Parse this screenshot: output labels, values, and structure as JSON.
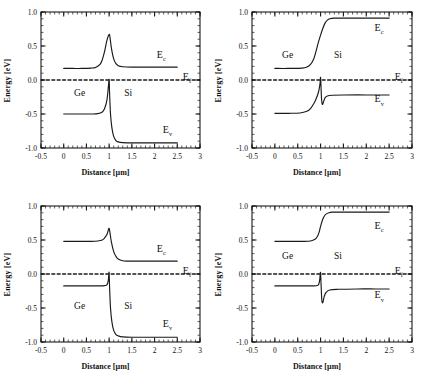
{
  "figure": {
    "panel_count": 4,
    "axis": {
      "xlabel": "Distance [µm]",
      "ylabel": "Energy [eV]",
      "xticks": [
        "-0.5",
        "0",
        "0.5",
        "1",
        "1.5",
        "2",
        "2.5",
        "3"
      ],
      "xtick_values": [
        -0.5,
        0,
        0.5,
        1,
        1.5,
        2,
        2.5,
        3
      ],
      "yticks": [
        "1.0",
        "0.5",
        "0.0",
        "-0.5",
        "-1.0"
      ],
      "ytick_values": [
        1.0,
        0.5,
        0.0,
        -0.5,
        -1.0
      ],
      "xlim": [
        -0.5,
        3
      ],
      "ylim": [
        -1.0,
        1.0
      ],
      "grid": false,
      "minor_tick_step_x": 0.1,
      "minor_tick_step_y": 0.1
    },
    "annotations": {
      "ec": "E",
      "ec_sub": "c",
      "ef": "E",
      "ef_sub": "f",
      "ev": "E",
      "ev_sub": "v",
      "region_left": "Ge",
      "region_right": "Si"
    },
    "colors": {
      "line": "#1a1a1a",
      "axis": "#1a1a1a",
      "background": "#ffffff",
      "text": "#111111"
    }
  },
  "chart_data": [
    {
      "type": "line",
      "title": "Top-left band diagram",
      "xlabel": "Distance [µm]",
      "ylabel": "Energy [eV]",
      "xlim": [
        -0.5,
        3
      ],
      "ylim": [
        -1.0,
        1.0
      ],
      "grid": false,
      "legend_position": "inline-right",
      "series": [
        {
          "name": "E_c",
          "label": "Ec",
          "label_x": 2.05,
          "label_y": 0.32,
          "x": [
            0,
            0.2,
            0.4,
            0.6,
            0.7,
            0.8,
            0.85,
            0.9,
            0.95,
            1.0,
            1.02,
            1.05,
            1.1,
            1.15,
            1.2,
            1.3,
            1.5,
            2.0,
            2.5
          ],
          "y": [
            0.17,
            0.17,
            0.17,
            0.175,
            0.185,
            0.23,
            0.3,
            0.42,
            0.58,
            0.67,
            0.62,
            0.47,
            0.31,
            0.24,
            0.21,
            0.195,
            0.19,
            0.19,
            0.19
          ]
        },
        {
          "name": "E_f",
          "label": "Ef",
          "label_x": 2.62,
          "label_y": 0.0,
          "dashed": true,
          "x": [
            -0.5,
            3
          ],
          "y": [
            0.0,
            0.0
          ]
        },
        {
          "name": "E_v",
          "label": "Ev",
          "label_x": 2.18,
          "label_y": -0.78,
          "x": [
            0,
            0.3,
            0.6,
            0.75,
            0.85,
            0.9,
            0.95,
            0.98,
            1.0,
            1.01,
            1.03,
            1.06,
            1.1,
            1.15,
            1.2,
            1.3,
            1.5,
            2.0,
            2.5
          ],
          "y": [
            -0.5,
            -0.5,
            -0.5,
            -0.495,
            -0.47,
            -0.42,
            -0.3,
            -0.12,
            0.01,
            -0.2,
            -0.5,
            -0.7,
            -0.83,
            -0.89,
            -0.91,
            -0.92,
            -0.925,
            -0.925,
            -0.925
          ]
        }
      ],
      "region_labels": [
        {
          "text": "Ge",
          "x": 0.35,
          "y": -0.23
        },
        {
          "text": "Si",
          "x": 1.42,
          "y": -0.23
        }
      ]
    },
    {
      "type": "line",
      "title": "Top-right band diagram",
      "xlabel": "Distance [µm]",
      "ylabel": "Energy [eV]",
      "xlim": [
        -0.5,
        3
      ],
      "ylim": [
        -1.0,
        1.0
      ],
      "grid": false,
      "legend_position": "inline-right",
      "series": [
        {
          "name": "E_c",
          "label": "Ec",
          "label_x": 2.18,
          "label_y": 0.72,
          "x": [
            0,
            0.3,
            0.6,
            0.7,
            0.78,
            0.85,
            0.9,
            0.95,
            1.0,
            1.05,
            1.1,
            1.15,
            1.2,
            1.3,
            1.5,
            2.0,
            2.5
          ],
          "y": [
            0.17,
            0.17,
            0.175,
            0.19,
            0.23,
            0.31,
            0.42,
            0.55,
            0.66,
            0.76,
            0.84,
            0.88,
            0.9,
            0.91,
            0.91,
            0.91,
            0.91
          ]
        },
        {
          "name": "E_f",
          "label": "Ef",
          "label_x": 2.62,
          "label_y": 0.0,
          "dashed": true,
          "x": [
            -0.5,
            3
          ],
          "y": [
            0.0,
            0.0
          ]
        },
        {
          "name": "E_v",
          "label": "Ev",
          "label_x": 2.18,
          "label_y": -0.33,
          "x": [
            0,
            0.3,
            0.55,
            0.7,
            0.78,
            0.85,
            0.9,
            0.94,
            0.97,
            0.99,
            1.0,
            1.01,
            1.02,
            1.04,
            1.07,
            1.1,
            1.15,
            1.25,
            1.5,
            2.0,
            2.5
          ],
          "y": [
            -0.49,
            -0.49,
            -0.485,
            -0.46,
            -0.42,
            -0.35,
            -0.28,
            -0.21,
            -0.13,
            -0.04,
            0.04,
            -0.1,
            -0.27,
            -0.36,
            -0.31,
            -0.26,
            -0.235,
            -0.225,
            -0.22,
            -0.22,
            -0.22
          ]
        }
      ],
      "region_labels": [
        {
          "text": "Ge",
          "x": 0.28,
          "y": 0.33
        },
        {
          "text": "Si",
          "x": 1.38,
          "y": 0.33
        }
      ]
    },
    {
      "type": "line",
      "title": "Bottom-left band diagram",
      "xlabel": "Distance [µm]",
      "ylabel": "Energy [eV]",
      "xlim": [
        -0.5,
        3
      ],
      "ylim": [
        -1.0,
        1.0
      ],
      "grid": false,
      "legend_position": "inline-right",
      "series": [
        {
          "name": "E_c",
          "label": "Ec",
          "label_x": 2.05,
          "label_y": 0.32,
          "x": [
            0,
            0.3,
            0.6,
            0.75,
            0.85,
            0.9,
            0.95,
            0.98,
            1.0,
            1.02,
            1.05,
            1.1,
            1.15,
            1.2,
            1.3,
            1.4,
            1.6,
            2.0,
            2.5
          ],
          "y": [
            0.48,
            0.48,
            0.48,
            0.485,
            0.5,
            0.53,
            0.58,
            0.64,
            0.67,
            0.6,
            0.47,
            0.33,
            0.26,
            0.22,
            0.195,
            0.19,
            0.19,
            0.19,
            0.19
          ]
        },
        {
          "name": "E_f",
          "label": "Ef",
          "label_x": 2.62,
          "label_y": 0.0,
          "dashed": true,
          "x": [
            -0.5,
            3
          ],
          "y": [
            0.0,
            0.0
          ]
        },
        {
          "name": "E_v",
          "label": "Ev",
          "label_x": 2.18,
          "label_y": -0.78,
          "x": [
            0,
            0.3,
            0.6,
            0.8,
            0.9,
            0.95,
            0.98,
            0.99,
            1.0,
            1.01,
            1.03,
            1.06,
            1.1,
            1.15,
            1.2,
            1.3,
            1.5,
            2.0,
            2.5
          ],
          "y": [
            -0.175,
            -0.175,
            -0.175,
            -0.175,
            -0.17,
            -0.16,
            -0.1,
            -0.03,
            0.02,
            -0.2,
            -0.5,
            -0.7,
            -0.83,
            -0.89,
            -0.91,
            -0.925,
            -0.93,
            -0.93,
            -0.93
          ]
        }
      ],
      "region_labels": [
        {
          "text": "Ge",
          "x": 0.35,
          "y": -0.52
        },
        {
          "text": "Si",
          "x": 1.42,
          "y": -0.52
        }
      ]
    },
    {
      "type": "line",
      "title": "Bottom-right band diagram",
      "xlabel": "Distance [µm]",
      "ylabel": "Energy [eV]",
      "xlim": [
        -0.5,
        3
      ],
      "ylim": [
        -1.0,
        1.0
      ],
      "grid": false,
      "legend_position": "inline-right",
      "series": [
        {
          "name": "E_c",
          "label": "Ec",
          "label_x": 2.18,
          "label_y": 0.66,
          "x": [
            0,
            0.3,
            0.6,
            0.78,
            0.88,
            0.93,
            0.97,
            1.0,
            1.04,
            1.08,
            1.12,
            1.18,
            1.25,
            1.4,
            1.8,
            2.2,
            2.5
          ],
          "y": [
            0.48,
            0.48,
            0.48,
            0.485,
            0.51,
            0.55,
            0.62,
            0.7,
            0.79,
            0.85,
            0.88,
            0.9,
            0.91,
            0.91,
            0.91,
            0.91,
            0.91
          ]
        },
        {
          "name": "E_f",
          "label": "Ef",
          "label_x": 2.62,
          "label_y": 0.0,
          "dashed": true,
          "x": [
            -0.5,
            3
          ],
          "y": [
            0.0,
            0.0
          ]
        },
        {
          "name": "E_v",
          "label": "Ev",
          "label_x": 2.18,
          "label_y": -0.36,
          "x": [
            0,
            0.3,
            0.6,
            0.85,
            0.93,
            0.96,
            0.98,
            0.99,
            1.0,
            1.01,
            1.02,
            1.03,
            1.05,
            1.08,
            1.12,
            1.2,
            1.4,
            1.8,
            2.2,
            2.5
          ],
          "y": [
            -0.175,
            -0.175,
            -0.175,
            -0.175,
            -0.17,
            -0.15,
            -0.09,
            -0.02,
            0.02,
            -0.14,
            -0.3,
            -0.4,
            -0.42,
            -0.33,
            -0.27,
            -0.235,
            -0.225,
            -0.22,
            -0.22,
            -0.22
          ]
        }
      ],
      "region_labels": [
        {
          "text": "Ge",
          "x": 0.28,
          "y": 0.22
        },
        {
          "text": "Si",
          "x": 1.38,
          "y": 0.22
        }
      ]
    }
  ]
}
